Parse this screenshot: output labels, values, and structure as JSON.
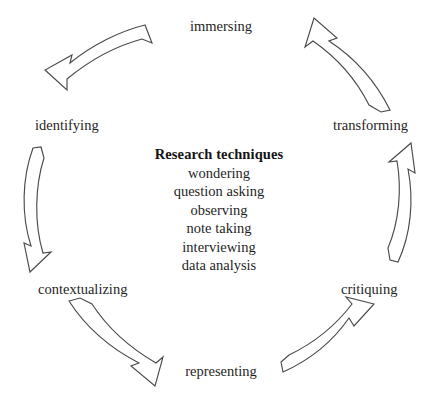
{
  "diagram": {
    "type": "cycle",
    "direction": "counterclockwise",
    "stages": [
      {
        "id": "immersing",
        "label": "immersing",
        "position": "top"
      },
      {
        "id": "transforming",
        "label": "transforming",
        "position": "right"
      },
      {
        "id": "critiquing",
        "label": "critiquing",
        "position": "bottom-right"
      },
      {
        "id": "representing",
        "label": "representing",
        "position": "bottom"
      },
      {
        "id": "contextualizing",
        "label": "contextualizing",
        "position": "bottom-left"
      },
      {
        "id": "identifying",
        "label": "identifying",
        "position": "left"
      }
    ],
    "arrows": [
      {
        "id": "arrow-immersing-to-identifying",
        "from": "immersing",
        "to": "identifying"
      },
      {
        "id": "arrow-identifying-to-contextualizing",
        "from": "identifying",
        "to": "contextualizing"
      },
      {
        "id": "arrow-contextualizing-to-representing",
        "from": "contextualizing",
        "to": "representing"
      },
      {
        "id": "arrow-representing-to-critiquing",
        "from": "representing",
        "to": "critiquing"
      },
      {
        "id": "arrow-critiquing-to-transforming",
        "from": "critiquing",
        "to": "transforming"
      },
      {
        "id": "arrow-transforming-to-immersing",
        "from": "transforming",
        "to": "immersing"
      }
    ],
    "center": {
      "title": "Research techniques",
      "items": [
        "wondering",
        "question asking",
        "observing",
        "note taking",
        "interviewing",
        "data analysis"
      ]
    },
    "colors": {
      "arrow_stroke": "#4a4a4a",
      "arrow_fill": "#ffffff",
      "text": "#1f1f1f",
      "background": "#ffffff"
    }
  }
}
